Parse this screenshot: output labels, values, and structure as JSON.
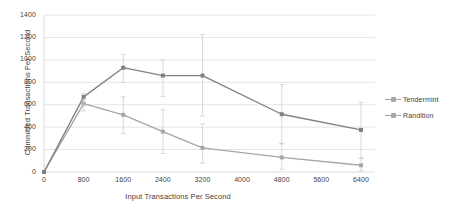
{
  "chart_data": {
    "type": "line",
    "title": "",
    "xlabel": "Input Transactions Per Second",
    "ylabel": "Committed Transactions Per Second",
    "xlim": [
      0,
      6400
    ],
    "ylim": [
      0,
      1400
    ],
    "grid": true,
    "legend_position": "right",
    "x": [
      0,
      800,
      1600,
      2400,
      3200,
      4800,
      6400
    ],
    "xticks": [
      "0",
      "800",
      "1600",
      "2400",
      "3200",
      "4000",
      "4800",
      "5600",
      "6400"
    ],
    "xtick_values": [
      0,
      800,
      1600,
      2400,
      3200,
      4000,
      4800,
      5600,
      6400
    ],
    "yticks": [
      "0",
      "200",
      "400",
      "600",
      "800",
      "1000",
      "1200",
      "1400"
    ],
    "ytick_values": [
      0,
      200,
      400,
      600,
      800,
      1000,
      1200,
      1400
    ],
    "series": [
      {
        "name": "Tendermint",
        "color": "#a6a6a6",
        "values": [
          0,
          610,
          510,
          360,
          215,
          130,
          60
        ],
        "error_low": [
          0,
          545,
          345,
          165,
          80,
          25,
          10
        ],
        "error_high": [
          0,
          640,
          670,
          555,
          430,
          250,
          120
        ]
      },
      {
        "name": "Randition",
        "color": "#808080",
        "values": [
          0,
          670,
          930,
          860,
          860,
          515,
          375
        ],
        "error_low": [
          0,
          600,
          800,
          675,
          500,
          255,
          125
        ],
        "error_high": [
          0,
          700,
          1050,
          1000,
          1225,
          780,
          620
        ]
      }
    ]
  },
  "legend": {
    "items": [
      {
        "label": "Tendermint"
      },
      {
        "label": "Randition"
      }
    ]
  }
}
